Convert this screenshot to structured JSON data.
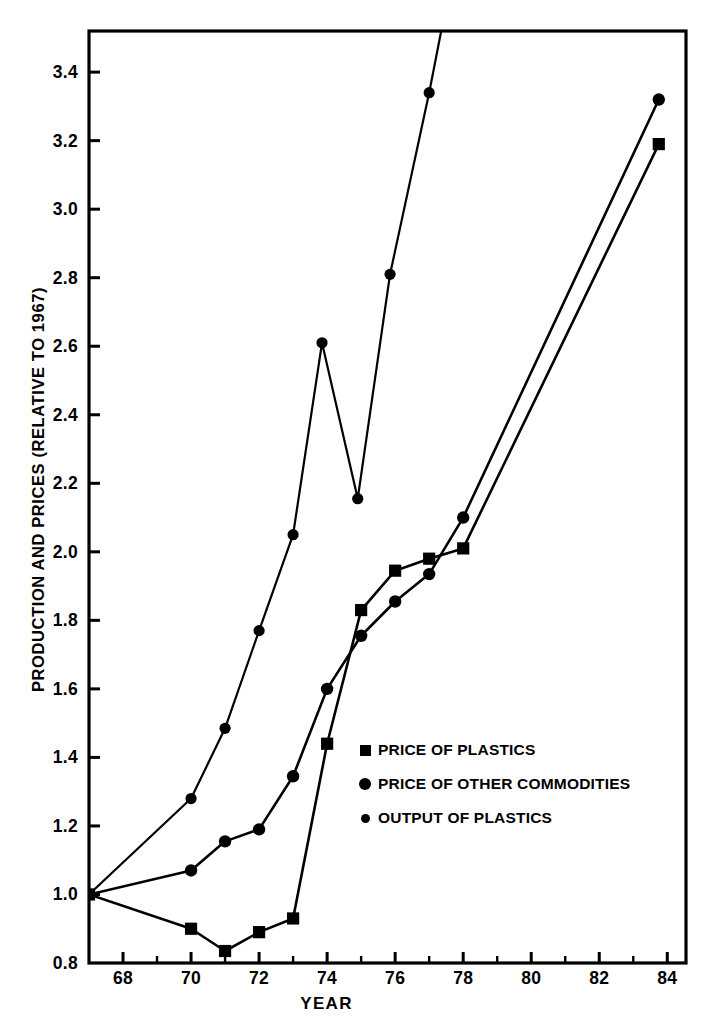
{
  "chart_data": {
    "type": "line",
    "title": "",
    "xlabel": "YEAR",
    "ylabel": "PRODUCTION AND PRICES (RELATIVE TO 1967)",
    "xlim": [
      1967,
      1984.55
    ],
    "ylim": [
      0.8,
      3.52
    ],
    "grid": false,
    "legend_position": "center",
    "x_major_ticks": [
      68,
      70,
      72,
      74,
      76,
      78,
      80,
      82,
      84
    ],
    "x_major_tick_labels": [
      "68",
      "70",
      "72",
      "74",
      "76",
      "78",
      "80",
      "82",
      "84"
    ],
    "x_minor_ticks": [
      69,
      71,
      73,
      75,
      77,
      79,
      81,
      83
    ],
    "y_ticks": [
      0.8,
      1.0,
      1.2,
      1.4,
      1.6,
      1.8,
      2.0,
      2.2,
      2.4,
      2.6,
      2.8,
      3.0,
      3.2,
      3.4
    ],
    "y_tick_labels": [
      "0.8",
      "1.0",
      "1.2",
      "1.4",
      "1.6",
      "1.8",
      "2.0",
      "2.2",
      "2.4",
      "2.6",
      "2.8",
      "3.0",
      "3.2",
      "3.4"
    ],
    "series": [
      {
        "name": "PRICE OF PLASTICS",
        "marker": "square",
        "x": [
          1967,
          1970,
          1971,
          1972,
          1973,
          1974,
          1975,
          1976,
          1977,
          1978,
          1983.75
        ],
        "values": [
          1.0,
          0.9,
          0.835,
          0.89,
          0.93,
          1.44,
          1.83,
          1.945,
          1.98,
          2.01,
          3.19
        ]
      },
      {
        "name": "PRICE OF OTHER COMMODITIES",
        "marker": "circle-large",
        "x": [
          1967,
          1970,
          1971,
          1972,
          1973,
          1974,
          1975,
          1976,
          1977,
          1978,
          1983.75
        ],
        "values": [
          1.0,
          1.07,
          1.155,
          1.19,
          1.345,
          1.6,
          1.755,
          1.855,
          1.935,
          2.1,
          3.32
        ]
      },
      {
        "name": "OUTPUT OF PLASTICS",
        "marker": "circle-small",
        "x": [
          1967,
          1970,
          1971,
          1972,
          1973,
          1973.85,
          1974.9,
          1975.85,
          1977.0,
          1978.1
        ],
        "values": [
          1.0,
          1.28,
          1.485,
          1.77,
          2.05,
          2.61,
          2.155,
          2.81,
          3.34,
          3.9
        ]
      }
    ]
  },
  "legend": {
    "items": [
      {
        "label": "PRICE OF PLASTICS",
        "marker": "square"
      },
      {
        "label": "PRICE OF OTHER COMMODITIES",
        "marker": "circle-large"
      },
      {
        "label": "OUTPUT OF PLASTICS",
        "marker": "circle-small"
      }
    ]
  }
}
